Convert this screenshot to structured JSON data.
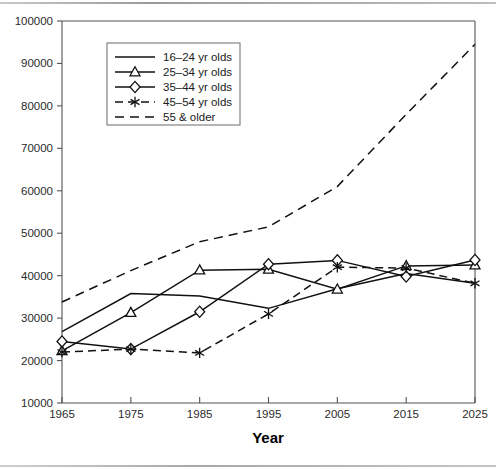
{
  "chart_data": {
    "type": "line",
    "title": "",
    "xlabel": "Year",
    "ylabel": "",
    "x": [
      1965,
      1975,
      1985,
      1995,
      2005,
      2015,
      2025
    ],
    "xtick_labels": [
      "1965",
      "1975",
      "1985",
      "1995",
      "2005",
      "2015",
      "2025"
    ],
    "ytick_labels": [
      "10000",
      "20000",
      "30000",
      "40000",
      "50000",
      "60000",
      "70000",
      "80000",
      "90000",
      "100000"
    ],
    "yticks": [
      10000,
      20000,
      30000,
      40000,
      50000,
      60000,
      70000,
      80000,
      90000,
      100000
    ],
    "xlim": [
      1965,
      2025
    ],
    "ylim": [
      10000,
      100000
    ],
    "grid": false,
    "legend_position": "upper-left-inside",
    "series": [
      {
        "name": "16–24 yr olds",
        "marker": "none",
        "line": "solid",
        "values": [
          26800,
          35800,
          35200,
          32300,
          36900,
          40500,
          38200
        ]
      },
      {
        "name": "25–34 yr olds",
        "marker": "triangle",
        "line": "solid",
        "values": [
          22300,
          31300,
          41300,
          41500,
          36800,
          42300,
          42500
        ]
      },
      {
        "name": "35–44 yr olds",
        "marker": "diamond",
        "line": "solid",
        "values": [
          24500,
          22700,
          31500,
          42700,
          43600,
          39800,
          43700
        ]
      },
      {
        "name": "45–54 yr olds",
        "marker": "asterisk",
        "line": "dashed",
        "values": [
          22000,
          22700,
          21800,
          31000,
          42000,
          41800,
          38200
        ]
      },
      {
        "name": "55 & older",
        "marker": "none",
        "line": "dashed",
        "values": [
          33800,
          41200,
          48000,
          51500,
          61000,
          78000,
          94500
        ]
      }
    ]
  },
  "legend": {
    "entries": [
      {
        "label": "16–24 yr olds"
      },
      {
        "label": "25–34 yr olds"
      },
      {
        "label": "35–44 yr olds"
      },
      {
        "label": "45–54 yr olds"
      },
      {
        "label": "55 & older"
      }
    ]
  },
  "colors": {
    "ink": "#111111",
    "axis": "#555555",
    "background": "#ffffff"
  }
}
